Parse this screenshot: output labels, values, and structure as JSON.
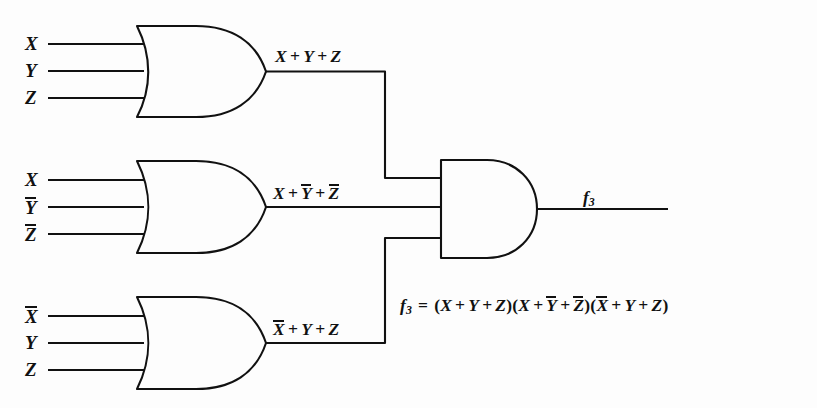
{
  "figure": {
    "type": "logic-circuit-diagram",
    "ink_color": "#111111",
    "background_color": "#fdfdfd"
  },
  "gates": [
    {
      "id": "or-gate-1",
      "type": "OR",
      "inputs": [
        {
          "label": "X",
          "overbar": false
        },
        {
          "label": "Y",
          "overbar": false
        },
        {
          "label": "Z",
          "overbar": false
        }
      ],
      "output_label_parts": [
        {
          "text": "X",
          "overbar": false
        },
        {
          "op": "+"
        },
        {
          "text": "Y",
          "overbar": false
        },
        {
          "op": "+"
        },
        {
          "text": "Z",
          "overbar": false
        }
      ],
      "output_label_plain": "X + Y + Z"
    },
    {
      "id": "or-gate-2",
      "type": "OR",
      "inputs": [
        {
          "label": "X",
          "overbar": false
        },
        {
          "label": "Y",
          "overbar": true
        },
        {
          "label": "Z",
          "overbar": true
        }
      ],
      "output_label_parts": [
        {
          "text": "X",
          "overbar": false
        },
        {
          "op": "+"
        },
        {
          "text": "Y",
          "overbar": true
        },
        {
          "op": "+"
        },
        {
          "text": "Z",
          "overbar": true
        }
      ],
      "output_label_plain": "X + Y̅ + Z̅"
    },
    {
      "id": "or-gate-3",
      "type": "OR",
      "inputs": [
        {
          "label": "X",
          "overbar": true
        },
        {
          "label": "Y",
          "overbar": false
        },
        {
          "label": "Z",
          "overbar": false
        }
      ],
      "output_label_parts": [
        {
          "text": "X",
          "overbar": true
        },
        {
          "op": "+"
        },
        {
          "text": "Y",
          "overbar": false
        },
        {
          "op": "+"
        },
        {
          "text": "Z",
          "overbar": false
        }
      ],
      "output_label_plain": "X̅ + Y + Z"
    },
    {
      "id": "and-gate",
      "type": "AND",
      "inputs": [],
      "output_label_plain": "f3"
    }
  ],
  "output": {
    "name": "f",
    "subscript": "3"
  },
  "equation": {
    "lhs_name": "f",
    "lhs_subscript": "3",
    "equals": "=",
    "plain": "f3 = (X + Y + Z)(X + Y̅ + Z̅)(X̅ + Y + Z)",
    "terms": [
      {
        "open": "(",
        "parts": [
          {
            "text": "X",
            "overbar": false
          },
          {
            "op": "+"
          },
          {
            "text": "Y",
            "overbar": false
          },
          {
            "op": "+"
          },
          {
            "text": "Z",
            "overbar": false
          }
        ],
        "close": ")"
      },
      {
        "open": "(",
        "parts": [
          {
            "text": "X",
            "overbar": false
          },
          {
            "op": "+"
          },
          {
            "text": "Y",
            "overbar": true
          },
          {
            "op": "+"
          },
          {
            "text": "Z",
            "overbar": true
          }
        ],
        "close": ")"
      },
      {
        "open": "(",
        "parts": [
          {
            "text": "X",
            "overbar": true
          },
          {
            "op": "+"
          },
          {
            "text": "Y",
            "overbar": false
          },
          {
            "op": "+"
          },
          {
            "text": "Z",
            "overbar": false
          }
        ],
        "close": ")"
      }
    ]
  }
}
